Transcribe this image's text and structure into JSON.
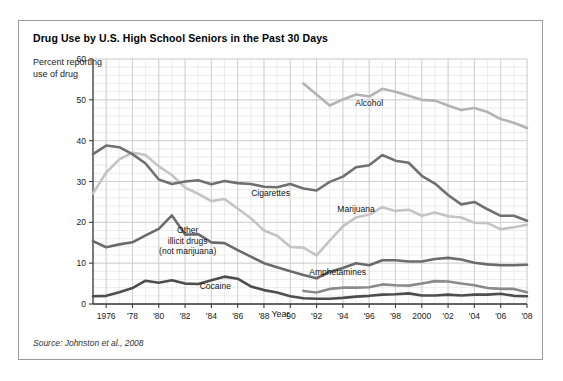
{
  "figure": {
    "title": "Drug Use by U.S. High School Seniors in the Past 30 Days",
    "source": "Source: Johnston et al., 2008",
    "border_color": "#9a9a9a"
  },
  "chart_data": {
    "type": "line",
    "title": "Drug Use by U.S. High School Seniors in the Past 30 Days",
    "xlabel": "Year",
    "ylabel": "Percent reporting use of drug",
    "ylim": [
      0,
      60
    ],
    "xlim": [
      1975,
      2008
    ],
    "yticks": [
      "0",
      "10",
      "20",
      "30",
      "40",
      "50",
      "60"
    ],
    "ytick_values": [
      0,
      10,
      20,
      30,
      40,
      50,
      60
    ],
    "xticks": [
      "1976",
      "'78",
      "'80",
      "'82",
      "'84",
      "'86",
      "'88",
      "'90",
      "'92",
      "'94",
      "'96",
      "'98",
      "2000",
      "'02",
      "'04",
      "'06",
      "'08"
    ],
    "xtick_values": [
      1976,
      1978,
      1980,
      1982,
      1984,
      1986,
      1988,
      1990,
      1992,
      1994,
      1996,
      1998,
      2000,
      2002,
      2004,
      2006,
      2008
    ],
    "grid": true,
    "grid_minor_y_step": 2,
    "grid_minor_x_step": 1,
    "legend_position": "inline-labels",
    "series": [
      {
        "name": "Alcohol",
        "color": "#b3b3b3",
        "label_x": 1996,
        "label_y": 48.5,
        "x": [
          1991,
          1992,
          1993,
          1994,
          1995,
          1996,
          1997,
          1998,
          1999,
          2000,
          2001,
          2002,
          2003,
          2004,
          2005,
          2006,
          2007,
          2008
        ],
        "values": [
          54.0,
          51.3,
          48.6,
          50.1,
          51.3,
          50.8,
          52.7,
          52.0,
          51.0,
          50.0,
          49.8,
          48.6,
          47.5,
          48.0,
          47.0,
          45.3,
          44.4,
          43.1
        ]
      },
      {
        "name": "Cigarettes",
        "color": "#707070",
        "label_x": 1988.5,
        "label_y": 26.5,
        "x": [
          1975,
          1976,
          1977,
          1978,
          1979,
          1980,
          1981,
          1982,
          1983,
          1984,
          1985,
          1986,
          1987,
          1988,
          1989,
          1990,
          1991,
          1992,
          1993,
          1994,
          1995,
          1996,
          1997,
          1998,
          1999,
          2000,
          2001,
          2002,
          2003,
          2004,
          2005,
          2006,
          2007,
          2008
        ],
        "values": [
          36.7,
          38.8,
          38.4,
          36.7,
          34.4,
          30.5,
          29.4,
          30.0,
          30.3,
          29.3,
          30.1,
          29.6,
          29.4,
          28.7,
          28.6,
          29.4,
          28.3,
          27.8,
          29.9,
          31.2,
          33.5,
          34.0,
          36.5,
          35.1,
          34.6,
          31.4,
          29.5,
          26.7,
          24.4,
          25.0,
          23.2,
          21.6,
          21.6,
          20.4
        ]
      },
      {
        "name": "Marijuana",
        "color": "#c4c4c4",
        "label_x": 1995,
        "label_y": 22.5,
        "x": [
          1975,
          1976,
          1977,
          1978,
          1979,
          1980,
          1981,
          1982,
          1983,
          1984,
          1985,
          1986,
          1987,
          1988,
          1989,
          1990,
          1991,
          1992,
          1993,
          1994,
          1995,
          1996,
          1997,
          1998,
          1999,
          2000,
          2001,
          2002,
          2003,
          2004,
          2005,
          2006,
          2007,
          2008
        ],
        "values": [
          27.1,
          32.2,
          35.4,
          37.1,
          36.5,
          33.7,
          31.6,
          28.5,
          27.0,
          25.2,
          25.7,
          23.4,
          21.0,
          18.0,
          16.7,
          14.0,
          13.8,
          11.9,
          15.5,
          19.0,
          21.2,
          21.9,
          23.7,
          22.8,
          23.1,
          21.6,
          22.4,
          21.5,
          21.2,
          19.9,
          19.8,
          18.3,
          18.8,
          19.4
        ]
      },
      {
        "name": "Other illicit drugs (not marijuana)",
        "color": "#6b6b6b",
        "label_x": 1982.2,
        "label_y": 17.3,
        "label_lines": [
          "Other",
          "illicit drugs",
          "(not marijuana)"
        ],
        "x": [
          1975,
          1976,
          1977,
          1978,
          1979,
          1980,
          1981,
          1982,
          1983,
          1984,
          1985,
          1986,
          1987,
          1988,
          1989,
          1990,
          1991,
          1992,
          1993,
          1994,
          1995,
          1996,
          1997,
          1998,
          1999,
          2000,
          2001,
          2002,
          2003,
          2004,
          2005,
          2006,
          2007,
          2008
        ],
        "values": [
          15.4,
          13.9,
          14.6,
          15.1,
          16.8,
          18.4,
          21.7,
          17.0,
          17.1,
          15.1,
          14.9,
          13.2,
          11.6,
          10.0,
          9.0,
          8.0,
          7.1,
          6.3,
          7.9,
          8.8,
          10.0,
          9.5,
          10.7,
          10.7,
          10.4,
          10.4,
          11.0,
          11.3,
          10.9,
          10.1,
          9.7,
          9.5,
          9.5,
          9.6
        ]
      },
      {
        "name": "Amphetamines",
        "color": "#8a8a8a",
        "label_x": 1993.6,
        "label_y": 7.0,
        "x": [
          1991,
          1992,
          1993,
          1994,
          1995,
          1996,
          1997,
          1998,
          1999,
          2000,
          2001,
          2002,
          2003,
          2004,
          2005,
          2006,
          2007,
          2008
        ],
        "values": [
          3.2,
          2.8,
          3.7,
          4.0,
          4.0,
          4.1,
          4.8,
          4.6,
          4.5,
          5.0,
          5.6,
          5.5,
          5.0,
          4.6,
          3.9,
          3.7,
          3.7,
          2.9
        ]
      },
      {
        "name": "Cocaine",
        "color": "#4d4d4d",
        "label_x": 1984.3,
        "label_y": 3.7,
        "x": [
          1975,
          1976,
          1977,
          1978,
          1979,
          1980,
          1981,
          1982,
          1983,
          1984,
          1985,
          1986,
          1987,
          1988,
          1989,
          1990,
          1991,
          1992,
          1993,
          1994,
          1995,
          1996,
          1997,
          1998,
          1999,
          2000,
          2001,
          2002,
          2003,
          2004,
          2005,
          2006,
          2007,
          2008
        ],
        "values": [
          1.9,
          2.0,
          2.9,
          3.9,
          5.7,
          5.2,
          5.8,
          5.0,
          4.9,
          5.8,
          6.7,
          6.2,
          4.3,
          3.4,
          2.8,
          1.9,
          1.4,
          1.3,
          1.3,
          1.5,
          1.8,
          2.0,
          2.3,
          2.4,
          2.6,
          2.1,
          2.1,
          2.3,
          2.1,
          2.3,
          2.3,
          2.5,
          2.0,
          1.9
        ]
      }
    ]
  }
}
